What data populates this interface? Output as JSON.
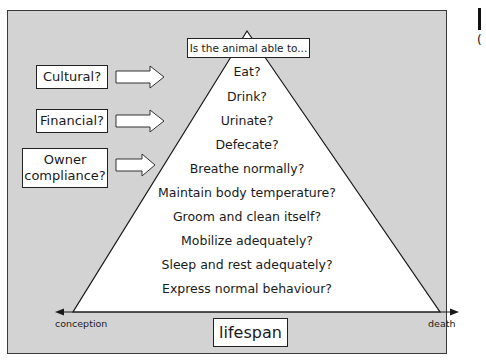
{
  "header_box": {
    "label": "Is the animal able to..."
  },
  "factors": [
    {
      "label": "Cultural?"
    },
    {
      "label": "Financial?"
    },
    {
      "label": "Owner compliance?"
    }
  ],
  "questions": [
    {
      "label": "Eat?"
    },
    {
      "label": "Drink?"
    },
    {
      "label": "Urinate?"
    },
    {
      "label": "Defecate?"
    },
    {
      "label": "Breathe normally?"
    },
    {
      "label": "Maintain body temperature?"
    },
    {
      "label": "Groom and clean itself?"
    },
    {
      "label": "Mobilize adequately?"
    },
    {
      "label": "Sleep and rest adequately?"
    },
    {
      "label": "Express normal behaviour?"
    }
  ],
  "axis": {
    "start_label": "conception",
    "end_label": "death",
    "title": "lifespan"
  },
  "edge": {
    "paren": "("
  },
  "colors": {
    "background_panel": "#d3d3d3",
    "triangle_fill": "#ffffff",
    "line": "#1a1a1a"
  }
}
